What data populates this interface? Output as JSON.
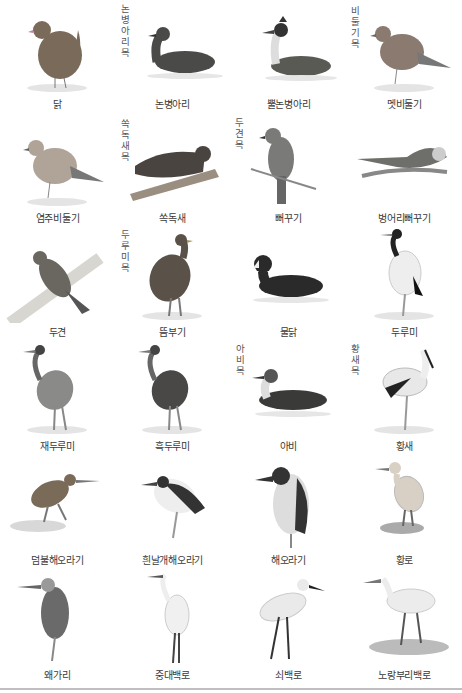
{
  "orders": [
    {
      "label": "논병아리목",
      "x": 119,
      "y": 3
    },
    {
      "label": "비둘기목",
      "x": 349,
      "y": 5
    },
    {
      "label": "쏙독새목",
      "x": 119,
      "y": 118
    },
    {
      "label": "두견목",
      "x": 233,
      "y": 117
    },
    {
      "label": "두루미목",
      "x": 119,
      "y": 229
    },
    {
      "label": "아비목",
      "x": 234,
      "y": 343
    },
    {
      "label": "황새목",
      "x": 349,
      "y": 343
    }
  ],
  "birds": [
    {
      "name": "닭",
      "shape": "chicken",
      "tone": "#7a6a5a"
    },
    {
      "name": "논병아리",
      "shape": "swimmer",
      "tone": "#4a4a48"
    },
    {
      "name": "뿔논병아리",
      "shape": "grebe",
      "tone": "#5a5a55"
    },
    {
      "name": "멧비둘기",
      "shape": "dove",
      "tone": "#8a7a70"
    },
    {
      "name": "염주비둘기",
      "shape": "dove",
      "tone": "#b0a398"
    },
    {
      "name": "쏙독새",
      "shape": "nightjar",
      "tone": "#4a4440"
    },
    {
      "name": "뻐꾸기",
      "shape": "cuckoo",
      "tone": "#7a7a78"
    },
    {
      "name": "벙어리뻐꾸기",
      "shape": "cuckoo-flat",
      "tone": "#6e6e6a"
    },
    {
      "name": "두견",
      "shape": "cuckoo-branch",
      "tone": "#6a6660"
    },
    {
      "name": "뜸부기",
      "shape": "rail",
      "tone": "#5a5248"
    },
    {
      "name": "물닭",
      "shape": "coot",
      "tone": "#2a2a2a"
    },
    {
      "name": "두루미",
      "shape": "crane-white",
      "tone": "#dcdcdc"
    },
    {
      "name": "재두루미",
      "shape": "crane",
      "tone": "#8a8a88"
    },
    {
      "name": "흑두루미",
      "shape": "crane",
      "tone": "#4a4846"
    },
    {
      "name": "아비",
      "shape": "loon",
      "tone": "#3a3a38"
    },
    {
      "name": "황새",
      "shape": "stork",
      "tone": "#e8e8e8"
    },
    {
      "name": "덤불해오라기",
      "shape": "bittern",
      "tone": "#7a6a58"
    },
    {
      "name": "흰날개해오라기",
      "shape": "pond-heron",
      "tone": "#3a3a3a"
    },
    {
      "name": "해오라기",
      "shape": "night-heron",
      "tone": "#3a3a3a"
    },
    {
      "name": "황로",
      "shape": "egret-small",
      "tone": "#d8d0c4"
    },
    {
      "name": "왜가리",
      "shape": "heron",
      "tone": "#6a6a6a"
    },
    {
      "name": "중대백로",
      "shape": "egret-tall",
      "tone": "#f0f0f0"
    },
    {
      "name": "쇠백로",
      "shape": "egret",
      "tone": "#eaeaea"
    },
    {
      "name": "노랑부리백로",
      "shape": "egret-wade",
      "tone": "#ececec"
    }
  ]
}
